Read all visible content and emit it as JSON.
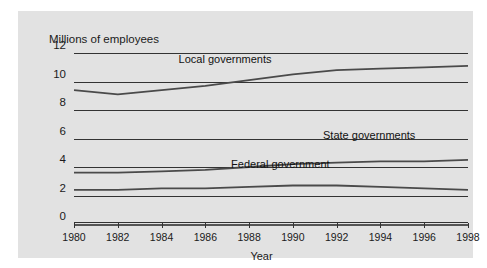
{
  "chart_data": {
    "type": "line",
    "title": "",
    "ylabel": "Millions of employees",
    "xlabel": "Year",
    "ylim": [
      0,
      12
    ],
    "ytick_labels": [
      "12",
      "10",
      "8",
      "6",
      "4",
      "2",
      "0"
    ],
    "ytick_values": [
      12,
      10,
      8,
      6,
      4,
      2,
      0
    ],
    "grid": true,
    "xlim": [
      1980,
      1998
    ],
    "xtick_labels": [
      "1980",
      "1982",
      "1984",
      "1986",
      "1988",
      "1990",
      "1992",
      "1994",
      "1996",
      "1998"
    ],
    "xtick_values": [
      1980,
      1982,
      1984,
      1986,
      1988,
      1990,
      1992,
      1994,
      1996,
      1998
    ],
    "x": [
      1980,
      1982,
      1984,
      1986,
      1988,
      1990,
      1992,
      1994,
      1996,
      1998
    ],
    "legend_position": "inline-annotations",
    "series": [
      {
        "name": "Local governments",
        "label": "Local governments",
        "color": "#4a4a4a",
        "values": [
          9.4,
          9.1,
          9.4,
          9.7,
          10.1,
          10.5,
          10.8,
          10.9,
          11.0,
          11.1
        ]
      },
      {
        "name": "State governments",
        "label": "State governments",
        "color": "#4a4a4a",
        "values": [
          3.6,
          3.6,
          3.7,
          3.8,
          4.0,
          4.2,
          4.3,
          4.4,
          4.4,
          4.5
        ]
      },
      {
        "name": "Federal government",
        "label": "Federal government",
        "color": "#4a4a4a",
        "values": [
          2.4,
          2.4,
          2.5,
          2.5,
          2.6,
          2.7,
          2.7,
          2.6,
          2.5,
          2.4
        ]
      }
    ]
  },
  "annotations": {
    "local": "Local governments",
    "state": "State governments",
    "federal": "Federal government"
  },
  "axis": {
    "y_axis_title": "Millions of employees",
    "x_axis_title": "Year"
  }
}
